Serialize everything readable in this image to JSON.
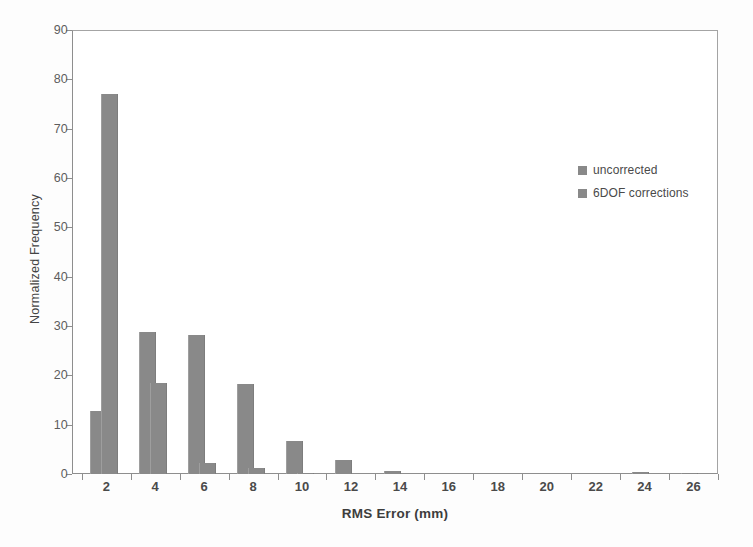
{
  "chart_data": {
    "type": "bar",
    "title": "",
    "subtitle": "",
    "xlabel": "RMS Error (mm)",
    "ylabel": "Normalized Frequency",
    "xlim": [
      0.6,
      27.0
    ],
    "ylim": [
      0,
      90
    ],
    "grid": false,
    "legend_position": "inside-right",
    "xticks": [
      2,
      4,
      6,
      8,
      10,
      12,
      14,
      16,
      18,
      20,
      22,
      24,
      26
    ],
    "yticks": [
      0,
      10,
      20,
      30,
      40,
      50,
      60,
      70,
      80,
      90
    ],
    "bar_color": "#898989",
    "frame_color": "#9a9a9a",
    "axis_text_color": "#4a4a4a",
    "series": [
      {
        "name": "uncorrected",
        "color": "#898989",
        "points": [
          {
            "x": 1.7,
            "value": 12.7
          },
          {
            "x": 3.7,
            "value": 28.7
          },
          {
            "x": 5.7,
            "value": 28.2
          },
          {
            "x": 7.7,
            "value": 18.3
          },
          {
            "x": 9.7,
            "value": 6.6
          },
          {
            "x": 11.7,
            "value": 2.8
          },
          {
            "x": 13.7,
            "value": 0.6
          }
        ]
      },
      {
        "name": "6DOF corrections",
        "color": "#898989",
        "points": [
          {
            "x": 2.15,
            "value": 77.0
          },
          {
            "x": 4.15,
            "value": 18.5
          },
          {
            "x": 6.15,
            "value": 2.2
          },
          {
            "x": 8.15,
            "value": 1.2
          },
          {
            "x": 10.15,
            "value": 0.3
          },
          {
            "x": 23.85,
            "value": 0.4
          },
          {
            "x": 25.85,
            "value": 0.3
          }
        ]
      }
    ]
  },
  "legend": {
    "entries": [
      {
        "label": "uncorrected",
        "color": "#898989"
      },
      {
        "label": "6DOF corrections",
        "color": "#898989"
      }
    ]
  },
  "axes": {
    "x_title": "RMS Error (mm)",
    "y_title": "Normalized Frequency",
    "x_tick_labels": [
      "2",
      "4",
      "6",
      "8",
      "10",
      "12",
      "14",
      "16",
      "18",
      "20",
      "22",
      "24",
      "26"
    ],
    "y_tick_labels": [
      "0",
      "10",
      "20",
      "30",
      "40",
      "50",
      "60",
      "70",
      "80",
      "90"
    ]
  }
}
